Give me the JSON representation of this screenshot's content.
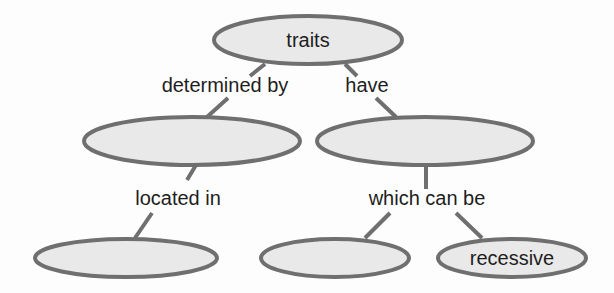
{
  "diagram": {
    "type": "concept-map",
    "nodes": [
      {
        "id": "traits",
        "label": "traits"
      },
      {
        "id": "mid_left",
        "label": ""
      },
      {
        "id": "mid_right",
        "label": ""
      },
      {
        "id": "bottom_left",
        "label": ""
      },
      {
        "id": "bottom_mid",
        "label": ""
      },
      {
        "id": "bottom_right",
        "label": "recessive"
      }
    ],
    "edges": [
      {
        "from": "traits",
        "to": "mid_left",
        "label": "determined by"
      },
      {
        "from": "traits",
        "to": "mid_right",
        "label": "have"
      },
      {
        "from": "mid_left",
        "to": "bottom_left",
        "label": "located in"
      },
      {
        "from": "mid_right",
        "to": "bottom_mid",
        "label": "which can be"
      },
      {
        "from": "mid_right",
        "to": "bottom_right",
        "label": "which can be"
      }
    ],
    "colors": {
      "node_fill": "#e9e9e9",
      "node_stroke": "#6f6f6f",
      "text": "#1e1e1e"
    }
  }
}
